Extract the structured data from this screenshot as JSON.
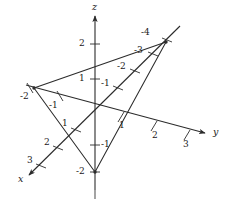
{
  "figure": {
    "kind": "3d-coordinate-axes-with-triangle",
    "background_color": "#ffffff",
    "line_color": "#2b2b2b",
    "text_color": "#1a1a1a",
    "width": 226,
    "height": 209
  },
  "axes": {
    "z": {
      "name": "z",
      "label_pos": {
        "x": 92,
        "y": 2
      },
      "ticks": [
        {
          "label": "2",
          "x": 79,
          "y": 39
        },
        {
          "label": "1",
          "x": 79,
          "y": 74
        },
        {
          "label": "-1",
          "x": 101,
          "y": 144
        },
        {
          "label": "-2",
          "x": 76,
          "y": 168
        }
      ]
    },
    "y": {
      "name": "y",
      "label_pos": {
        "x": 213,
        "y": 127
      },
      "ticks": [
        {
          "label": "1",
          "x": 119,
          "y": 121
        },
        {
          "label": "2",
          "x": 152,
          "y": 131
        },
        {
          "label": "3",
          "x": 183,
          "y": 140
        },
        {
          "label": "-1",
          "x": 51,
          "y": 103
        },
        {
          "label": "-2",
          "x": 22,
          "y": 93
        }
      ]
    },
    "x": {
      "name": "x",
      "label_pos": {
        "x": 18,
        "y": 174
      },
      "ticks": [
        {
          "label": "1",
          "x": 62,
          "y": 122
        },
        {
          "label": "2",
          "x": 44,
          "y": 141
        },
        {
          "label": "3",
          "x": 27,
          "y": 160
        },
        {
          "label": "-1",
          "x": 103,
          "y": 83
        },
        {
          "label": "-2",
          "x": 117,
          "y": 67
        },
        {
          "label": "-3",
          "x": 134,
          "y": 50
        },
        {
          "label": "-4",
          "x": 141,
          "y": 32
        }
      ]
    }
  },
  "triangle": {
    "vertices": [
      {
        "name": "x-intercept",
        "axis": "x",
        "value": -4,
        "x": 166,
        "y": 42
      },
      {
        "name": "y-intercept",
        "axis": "y",
        "value": -2,
        "x": 34,
        "y": 88
      },
      {
        "name": "z-intercept",
        "axis": "z",
        "value": -2,
        "x": 95,
        "y": 172
      }
    ]
  }
}
